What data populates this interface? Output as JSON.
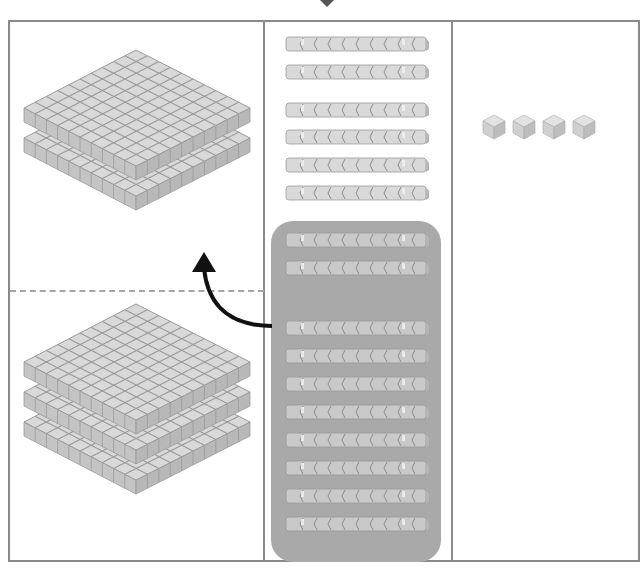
{
  "diagram": {
    "type": "base-ten-blocks-regrouping",
    "columns": [
      {
        "name": "hundreds",
        "groups": [
          {
            "position": "top",
            "flats": 2
          },
          {
            "position": "bottom",
            "flats": 3
          }
        ]
      },
      {
        "name": "tens",
        "loose_rods": 6,
        "grouped_rods": 10
      },
      {
        "name": "ones",
        "units": 4
      }
    ],
    "annotation": {
      "arrow": "regroup-10-tens-into-1-hundred",
      "from": "tens-group",
      "to": "hundreds-top"
    },
    "colors": {
      "frame": "#8a8a8a",
      "block_face": "#d9d9d9",
      "block_edge": "#9a9a9a",
      "group_highlight": "#a9a9a9",
      "arrow": "#111111",
      "dash": "#a5a5a5"
    }
  }
}
